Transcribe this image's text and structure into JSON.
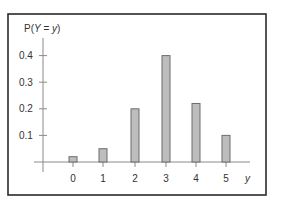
{
  "chart_data": {
    "type": "bar",
    "title": "",
    "ylabel": "P(Y = y)",
    "xlabel": "y",
    "categories": [
      "0",
      "1",
      "2",
      "3",
      "4",
      "5"
    ],
    "values": [
      0.02,
      0.05,
      0.2,
      0.4,
      0.22,
      0.1
    ],
    "yticks": [
      "0.1",
      "0.2",
      "0.3",
      "0.4"
    ],
    "ylim": [
      0,
      0.45
    ],
    "grid": false,
    "legend": null
  },
  "style": {
    "bar_fill": "#bdbdbd",
    "bar_stroke": "#6d6d6d",
    "axis_color": "#8a8a8a",
    "frame_color": "#2a2a2a"
  }
}
